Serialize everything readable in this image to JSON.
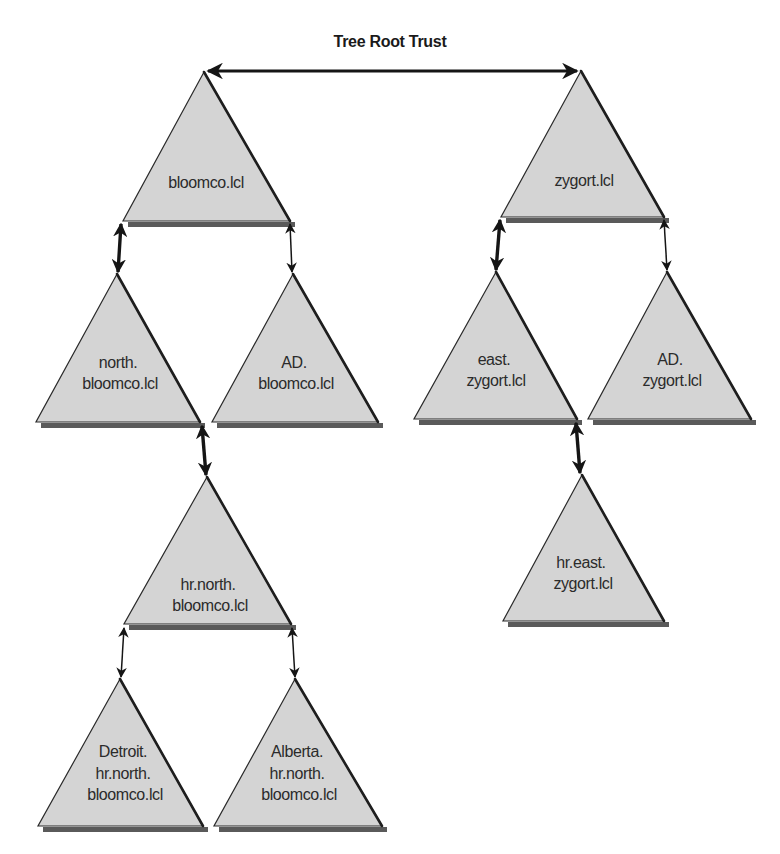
{
  "diagram": {
    "title": "Tree Root Trust",
    "colors": {
      "triangle_fill": "#d4d4d4",
      "triangle_edge": "#1e1e1e",
      "shadow": "#5a5a5a",
      "text": "#2b2b2b",
      "arrow": "#151515"
    },
    "trees": [
      {
        "root": "bloomco.lcl",
        "domains": [
          {
            "id": "bloomco",
            "lines": [
              "bloomco.lcl"
            ]
          },
          {
            "id": "north-bloomco",
            "lines": [
              "north.",
              "bloomco.lcl"
            ]
          },
          {
            "id": "ad-bloomco",
            "lines": [
              "AD.",
              "bloomco.lcl"
            ]
          },
          {
            "id": "hr-north-bloomco",
            "lines": [
              "hr.north.",
              "bloomco.lcl"
            ]
          },
          {
            "id": "detroit-hr-north-bloomco",
            "lines": [
              "Detroit.",
              "hr.north.",
              "bloomco.lcl"
            ]
          },
          {
            "id": "alberta-hr-north-bloomco",
            "lines": [
              "Alberta.",
              "hr.north.",
              "bloomco.lcl"
            ]
          }
        ]
      },
      {
        "root": "zygort.lcl",
        "domains": [
          {
            "id": "zygort",
            "lines": [
              "zygort.lcl"
            ]
          },
          {
            "id": "east-zygort",
            "lines": [
              "east.",
              "zygort.lcl"
            ]
          },
          {
            "id": "ad-zygort",
            "lines": [
              "AD.",
              "zygort.lcl"
            ]
          },
          {
            "id": "hr-east-zygort",
            "lines": [
              "hr.east.",
              "zygort.lcl"
            ]
          }
        ]
      }
    ],
    "trusts": [
      {
        "from": "bloomco.lcl",
        "to": "zygort.lcl",
        "type": "tree-root",
        "style": "thick"
      },
      {
        "from": "bloomco.lcl",
        "to": "north.bloomco.lcl",
        "type": "parent-child",
        "style": "thick"
      },
      {
        "from": "bloomco.lcl",
        "to": "AD.bloomco.lcl",
        "type": "parent-child",
        "style": "thin"
      },
      {
        "from": "north.bloomco.lcl",
        "to": "hr.north.bloomco.lcl",
        "type": "parent-child",
        "style": "thick"
      },
      {
        "from": "hr.north.bloomco.lcl",
        "to": "Detroit.hr.north.bloomco.lcl",
        "type": "parent-child",
        "style": "thin"
      },
      {
        "from": "hr.north.bloomco.lcl",
        "to": "Alberta.hr.north.bloomco.lcl",
        "type": "parent-child",
        "style": "thin"
      },
      {
        "from": "zygort.lcl",
        "to": "east.zygort.lcl",
        "type": "parent-child",
        "style": "thick"
      },
      {
        "from": "zygort.lcl",
        "to": "AD.zygort.lcl",
        "type": "parent-child",
        "style": "thin"
      },
      {
        "from": "east.zygort.lcl",
        "to": "hr.east.zygort.lcl",
        "type": "parent-child",
        "style": "thick"
      }
    ]
  },
  "t": {
    "title": "Tree Root Trust",
    "bloomco": [
      "bloomco.lcl"
    ],
    "north": [
      "north.",
      "bloomco.lcl"
    ],
    "adb": [
      "AD.",
      "bloomco.lcl"
    ],
    "hrnorth": [
      "hr.north.",
      "bloomco.lcl"
    ],
    "detroit": [
      "Detroit.",
      "hr.north.",
      "bloomco.lcl"
    ],
    "alberta": [
      "Alberta.",
      "hr.north.",
      "bloomco.lcl"
    ],
    "zygort": [
      "zygort.lcl"
    ],
    "east": [
      "east.",
      "zygort.lcl"
    ],
    "adz": [
      "AD.",
      "zygort.lcl"
    ],
    "hreast": [
      "hr.east.",
      "zygort.lcl"
    ]
  }
}
